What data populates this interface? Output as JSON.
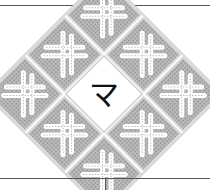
{
  "diagram": {
    "center_glyph": "マ",
    "tile_count": 8,
    "layout": "3x3 grid rotated 45 degrees, center cell holds glyph, 8 surrounding cells hold interlaced knot pattern",
    "colors": {
      "tile_fill": "#a8a8a8",
      "tile_border": "#cfcfcf",
      "knot": "#f4f4f4",
      "center": "#ffffff",
      "glyph": "#111111",
      "rule": "#555555"
    }
  }
}
